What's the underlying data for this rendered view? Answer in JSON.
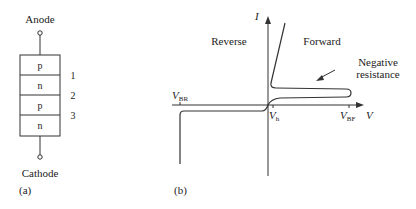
{
  "panel_a": {
    "caption": "(a)",
    "anode_label": "Anode",
    "cathode_label": "Cathode",
    "layers": [
      "p",
      "n",
      "p",
      "n"
    ],
    "junctions": [
      "1",
      "2",
      "3"
    ]
  },
  "panel_b": {
    "caption": "(b)",
    "y_axis_label": "I",
    "x_axis_label": "V",
    "region_reverse": "Reverse",
    "region_forward": "Forward",
    "annotation_line1": "Negative",
    "annotation_line2": "resistance",
    "vbr": {
      "main": "V",
      "sub": "BR"
    },
    "vh": {
      "main": "V",
      "sub": "h"
    },
    "vbf": {
      "main": "V",
      "sub": "BF"
    }
  },
  "colors": {
    "stroke": "#333333",
    "background": "#ffffff"
  }
}
